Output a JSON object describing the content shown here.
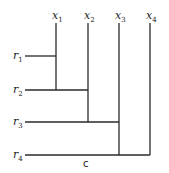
{
  "diagram": {
    "type": "staircase-dendrogram",
    "columns": [
      {
        "id": "x1",
        "base": "x",
        "sub": "1",
        "x": 56,
        "y_end": 90
      },
      {
        "id": "x2",
        "base": "x",
        "sub": "2",
        "x": 88,
        "y_end": 122
      },
      {
        "id": "x3",
        "base": "x",
        "sub": "3",
        "x": 119,
        "y_end": 155
      },
      {
        "id": "x4",
        "base": "x",
        "sub": "4",
        "x": 150,
        "y_end": 155
      }
    ],
    "rows": [
      {
        "id": "r1",
        "base": "r",
        "sub": "1",
        "y": 56,
        "x_end": 56
      },
      {
        "id": "r2",
        "base": "r",
        "sub": "2",
        "y": 90,
        "x_end": 88
      },
      {
        "id": "r3",
        "base": "r",
        "sub": "3",
        "y": 122,
        "x_end": 119
      },
      {
        "id": "r4",
        "base": "r",
        "sub": "4",
        "y": 155,
        "x_end": 150
      }
    ],
    "bottom_label": "c",
    "line_color": "#2a2a2a"
  }
}
